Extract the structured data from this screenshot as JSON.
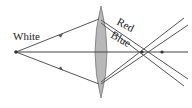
{
  "diagram": {
    "labels": {
      "source": "White",
      "red": "Red",
      "blue": "Blue"
    },
    "colors": {
      "lens_fill": "#b8b8b8",
      "lens_stroke": "#7a7a7a",
      "ray": "#555555",
      "axis": "#444444",
      "text": "#222222"
    },
    "geometry": {
      "source": [
        16,
        52
      ],
      "lens_center_x": 101,
      "lens_top": 6,
      "lens_bottom": 98,
      "upper_hit": [
        99,
        19
      ],
      "lower_hit": [
        99,
        84
      ],
      "blue_focus": [
        142,
        52
      ],
      "red_focus": [
        162,
        52
      ]
    }
  }
}
